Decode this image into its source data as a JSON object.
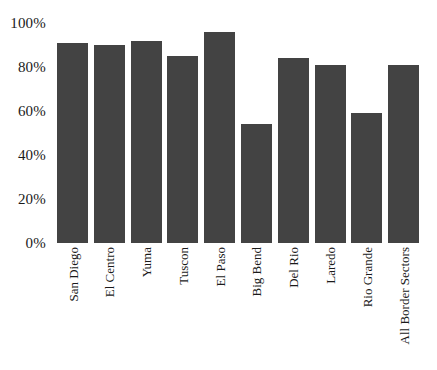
{
  "chart_data": {
    "type": "bar",
    "title": "",
    "subtitle": "",
    "xlabel": "",
    "ylabel": "",
    "categories": [
      "San Diego",
      "El Centro",
      "Yuma",
      "Tuscon",
      "El Paso",
      "Big Bend",
      "Del Rio",
      "Laredo",
      "Rio Grande",
      "All Border Sectors"
    ],
    "values": [
      91,
      90,
      92,
      85,
      96,
      54,
      84,
      81,
      59,
      81
    ],
    "value_suffix": "%",
    "ylim": [
      0,
      100
    ],
    "y_ticks": [
      0,
      20,
      40,
      60,
      80,
      100
    ],
    "y_tick_labels": [
      "0%",
      "20%",
      "40%",
      "60%",
      "80%",
      "100%"
    ],
    "grid": false,
    "legend": null,
    "legend_position": "none",
    "bar_color": "#434343",
    "background_color": "#ffffff",
    "x_tick_rotation": -90
  }
}
